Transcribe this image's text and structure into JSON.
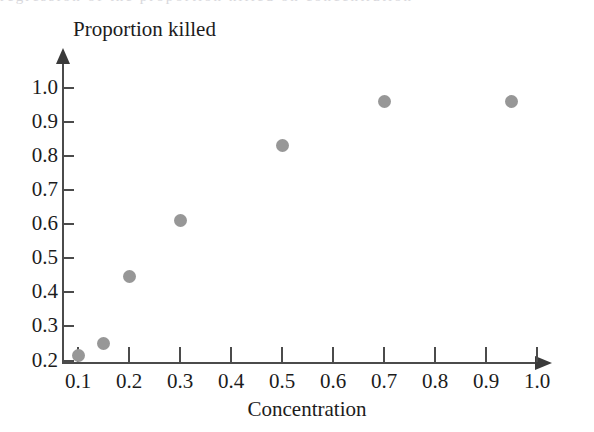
{
  "figure": {
    "top_clipped_text": "regression of the proportion killed on concentration",
    "marker_color": "#979797",
    "axis_color": "#4b4b4b"
  },
  "chart_data": {
    "type": "scatter",
    "title": "",
    "xlabel": "Concentration",
    "ylabel": "Proportion killed",
    "xlim": [
      0.05,
      1.03
    ],
    "ylim": [
      0.19,
      1.02
    ],
    "xticks": [
      0.1,
      0.2,
      0.3,
      0.4,
      0.5,
      0.6,
      0.7,
      0.8,
      0.9,
      1.0
    ],
    "xtick_labels": [
      "0.1",
      "0.2",
      "0.3",
      "0.4",
      "0.5",
      "0.6",
      "0.7",
      "0.8",
      "0.9",
      "1.0"
    ],
    "yticks": [
      0.2,
      0.3,
      0.4,
      0.5,
      0.6,
      0.7,
      0.8,
      0.9,
      1.0
    ],
    "ytick_labels": [
      "0.2",
      "0.3",
      "0.4",
      "0.5",
      "0.6",
      "0.7",
      "0.8",
      "0.9",
      "1.0"
    ],
    "grid": false,
    "legend": null,
    "axis_arrows": true,
    "series": [
      {
        "name": "Proportion killed",
        "marker": "circle",
        "color": "#979797",
        "x": [
          0.1,
          0.15,
          0.2,
          0.3,
          0.5,
          0.7,
          0.95
        ],
        "y": [
          0.215,
          0.25,
          0.445,
          0.61,
          0.83,
          0.96,
          0.96
        ]
      }
    ]
  }
}
